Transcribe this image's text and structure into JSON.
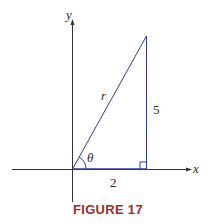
{
  "figure": {
    "caption": "FIGURE 17",
    "caption_color": "#9b2d2d",
    "line_color": "#2e3f8f",
    "axes": {
      "x_label": "x",
      "y_label": "y"
    },
    "triangle": {
      "hypotenuse_label": "r",
      "vertical_side_label": "5",
      "horizontal_side_label": "2",
      "angle_label": "θ",
      "right_angle_marker": true
    }
  }
}
